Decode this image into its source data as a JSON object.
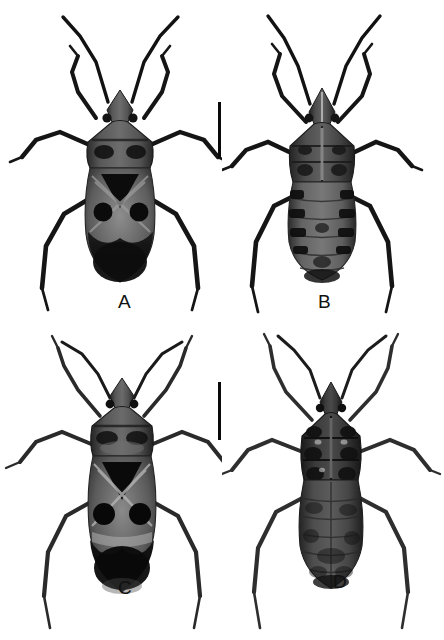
{
  "figure": {
    "type": "scientific-specimen-plate",
    "background_color": "#ffffff",
    "ink_color": "#0a0a0a",
    "panel_count": 4,
    "scale_bar_count": 2
  },
  "panels": [
    {
      "id": "A",
      "label": "A",
      "view": "dorsal",
      "label_x": 118,
      "label_y": 292,
      "specimen": {
        "name": "specimen-a-dorsal",
        "body_cx": 120,
        "body_top": 100,
        "body_bottom": 282,
        "body_halfwidth": 33,
        "tone": "dark",
        "markings": "pale X-band with two round black spots and black scutellar triangle"
      }
    },
    {
      "id": "B",
      "label": "B",
      "view": "ventral",
      "label_x": 318,
      "label_y": 292,
      "specimen": {
        "name": "specimen-b-ventral",
        "body_cx": 322,
        "body_top": 100,
        "body_bottom": 278,
        "body_halfwidth": 31,
        "tone": "dark",
        "markings": "segmented abdomen with lateral dark bands"
      }
    },
    {
      "id": "C",
      "label": "C",
      "view": "dorsal",
      "label_x": 123,
      "label_y": 580,
      "specimen": {
        "name": "specimen-c-dorsal",
        "body_cx": 122,
        "body_top": 400,
        "body_bottom": 572,
        "body_halfwidth": 31,
        "tone": "dark",
        "markings": "pale X-band with two round black spots and black scutellar triangle"
      }
    },
    {
      "id": "D",
      "label": "D",
      "view": "ventral",
      "label_x": 333,
      "label_y": 572,
      "specimen": {
        "name": "specimen-d-ventral",
        "body_cx": 330,
        "body_top": 398,
        "body_bottom": 566,
        "body_halfwidth": 30,
        "tone": "dark",
        "markings": "uniformly dark ventral surface with faint segment lines"
      }
    }
  ],
  "scale_bars": [
    {
      "name": "scale-bar-top",
      "x": 218,
      "y": 102,
      "width": 3,
      "height": 56
    },
    {
      "name": "scale-bar-bottom",
      "x": 218,
      "y": 382,
      "width": 3,
      "height": 58
    }
  ]
}
